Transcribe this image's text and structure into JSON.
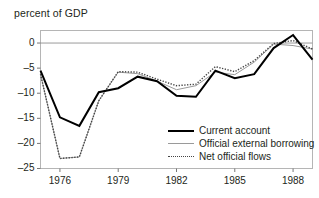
{
  "chart_data": {
    "type": "line",
    "title": "percent of GDP",
    "xlabel": "",
    "ylabel": "",
    "xlim": [
      1975,
      1989
    ],
    "ylim": [
      -25,
      2.5
    ],
    "yticks": [
      0,
      -5,
      -10,
      -15,
      -20,
      -25
    ],
    "ytick_labels": [
      "0",
      "–5",
      "–10",
      "–15",
      "–20",
      "–25"
    ],
    "xticks": [
      1976,
      1979,
      1982,
      1985,
      1988
    ],
    "xtick_labels": [
      "1976",
      "1979",
      "1982",
      "1985",
      "1988"
    ],
    "grid": false,
    "zero_line": true,
    "legend_position": "lower right",
    "x": [
      1975,
      1976,
      1977,
      1978,
      1979,
      1980,
      1981,
      1982,
      1983,
      1984,
      1985,
      1986,
      1987,
      1988,
      1989
    ],
    "series": [
      {
        "name": "Current account",
        "style": "solid-thick",
        "color": "#000000",
        "values": [
          -5.5,
          -14.8,
          -16.5,
          -9.8,
          -9.0,
          -6.7,
          -7.6,
          -10.5,
          -10.7,
          -5.5,
          -7.0,
          -6.2,
          -1.0,
          1.6,
          -3.3
        ]
      },
      {
        "name": "Official external borrowing",
        "style": "solid-thin",
        "color": "#9a9a9a",
        "values": [
          -6.2,
          -23.0,
          -22.7,
          -11.5,
          -5.8,
          -6.1,
          -7.6,
          -9.3,
          -8.5,
          -5.8,
          -6.3,
          -3.8,
          -0.2,
          -0.5,
          -1.2
        ]
      },
      {
        "name": "Net official flows",
        "style": "dotted",
        "color": "#444444",
        "values": [
          -6.2,
          -23.0,
          -22.7,
          -11.5,
          -5.7,
          -5.8,
          -7.2,
          -8.5,
          -8.2,
          -4.7,
          -5.7,
          -3.5,
          -0.1,
          0.5,
          -1.2
        ]
      }
    ]
  },
  "legend": {
    "items": [
      {
        "label": "Current account",
        "key": "line-solid-thick-icon"
      },
      {
        "label": "Official external borrowing",
        "key": "line-solid-thin-icon"
      },
      {
        "label": "Net official flows",
        "key": "line-dotted-icon"
      }
    ]
  }
}
